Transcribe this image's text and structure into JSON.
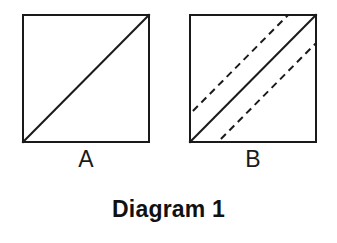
{
  "figure": {
    "caption": "Diagram 1",
    "background_color": "#ffffff",
    "stroke_color": "#1a1a1a",
    "panels": [
      {
        "id": "A",
        "label": "A",
        "shape": "square",
        "x": 22,
        "y": 14,
        "width": 128,
        "height": 129,
        "border_width": 2,
        "elements": [
          {
            "kind": "line",
            "name": "diagonal",
            "style": "solid",
            "stroke_width": 2,
            "from": "bottom-left",
            "to": "top-right"
          }
        ]
      },
      {
        "id": "B",
        "label": "B",
        "shape": "square",
        "x": 189,
        "y": 14,
        "width": 128,
        "height": 129,
        "border_width": 2,
        "elements": [
          {
            "kind": "line",
            "name": "diagonal",
            "style": "solid",
            "stroke_width": 2,
            "from": "bottom-left",
            "to": "top-right"
          },
          {
            "kind": "line",
            "name": "dashed-offset-upper",
            "style": "dashed",
            "stroke_width": 2,
            "dash": "7 5",
            "offset": -20,
            "parallel_to": "diagonal"
          },
          {
            "kind": "line",
            "name": "dashed-offset-lower",
            "style": "dashed",
            "stroke_width": 2,
            "dash": "7 5",
            "offset": 20,
            "parallel_to": "diagonal"
          }
        ]
      }
    ]
  }
}
